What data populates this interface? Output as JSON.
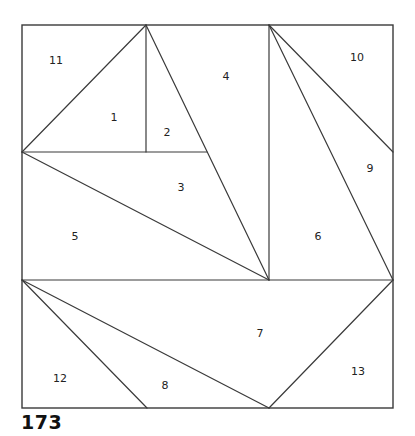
{
  "pattern": {
    "number": "173",
    "line_color": "#3a3a3a",
    "background": "#ffffff"
  },
  "frame": {
    "x": 22,
    "y": 25,
    "width": 371,
    "height": 383
  },
  "edges": [
    {
      "id": "mid-horizontal-left",
      "x1": 22,
      "y1": 152,
      "x2": 207,
      "y2": 152
    },
    {
      "id": "center-horizontal",
      "x1": 22,
      "y1": 280,
      "x2": 393,
      "y2": 280
    },
    {
      "id": "a-to-left",
      "x1": 146,
      "y1": 25,
      "x2": 22,
      "y2": 152
    },
    {
      "id": "a-vertical",
      "x1": 146,
      "y1": 25,
      "x2": 146,
      "y2": 152
    },
    {
      "id": "a-to-center",
      "x1": 146,
      "y1": 25,
      "x2": 269,
      "y2": 280
    },
    {
      "id": "left-to-center",
      "x1": 22,
      "y1": 152,
      "x2": 269,
      "y2": 280
    },
    {
      "id": "b-vertical",
      "x1": 269,
      "y1": 25,
      "x2": 269,
      "y2": 280
    },
    {
      "id": "b-to-right-mid",
      "x1": 269,
      "y1": 25,
      "x2": 393,
      "y2": 152
    },
    {
      "id": "b-to-right-center",
      "x1": 269,
      "y1": 25,
      "x2": 393,
      "y2": 280
    },
    {
      "id": "left-center-to-bottom",
      "x1": 22,
      "y1": 280,
      "x2": 147,
      "y2": 408
    },
    {
      "id": "left-center-to-bottom-mid",
      "x1": 22,
      "y1": 280,
      "x2": 269,
      "y2": 408
    },
    {
      "id": "right-center-to-bottom-mid",
      "x1": 393,
      "y1": 280,
      "x2": 269,
      "y2": 408
    }
  ],
  "pieces": [
    {
      "label": "1",
      "x": 114,
      "y": 118
    },
    {
      "label": "2",
      "x": 167,
      "y": 133
    },
    {
      "label": "3",
      "x": 181,
      "y": 188
    },
    {
      "label": "4",
      "x": 226,
      "y": 77
    },
    {
      "label": "5",
      "x": 75,
      "y": 237
    },
    {
      "label": "6",
      "x": 318,
      "y": 237
    },
    {
      "label": "7",
      "x": 260,
      "y": 334
    },
    {
      "label": "8",
      "x": 165,
      "y": 386
    },
    {
      "label": "9",
      "x": 370,
      "y": 169
    },
    {
      "label": "10",
      "x": 357,
      "y": 58
    },
    {
      "label": "11",
      "x": 56,
      "y": 61
    },
    {
      "label": "12",
      "x": 60,
      "y": 379
    },
    {
      "label": "13",
      "x": 358,
      "y": 372
    }
  ]
}
